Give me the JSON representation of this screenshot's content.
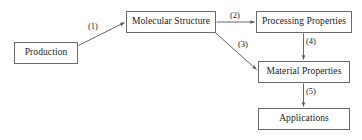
{
  "diagram": {
    "background_color": "#ffffff",
    "line_color": "#555555",
    "box_border_color": "#6b6b6b",
    "text_color": "#1a1a1a",
    "nodes": [
      {
        "id": "production",
        "label": "Production",
        "x": 14,
        "y": 42,
        "w": 64,
        "h": 22
      },
      {
        "id": "molecular-structure",
        "label": "Molecular Structure",
        "x": 126,
        "y": 11,
        "w": 90,
        "h": 22
      },
      {
        "id": "processing-properties",
        "label": "Processing Properties",
        "x": 256,
        "y": 11,
        "w": 96,
        "h": 22
      },
      {
        "id": "material-properties",
        "label": "Material Properties",
        "x": 258,
        "y": 61,
        "w": 92,
        "h": 22
      },
      {
        "id": "applications",
        "label": "Applications",
        "x": 258,
        "y": 108,
        "w": 92,
        "h": 22
      }
    ],
    "edges": [
      {
        "id": "e1",
        "label": "(1)",
        "from": "production",
        "to": "molecular-structure",
        "label_x": 88,
        "label_y": 22
      },
      {
        "id": "e2",
        "label": "(2)",
        "from": "molecular-structure",
        "to": "processing-properties",
        "label_x": 230,
        "label_y": 11
      },
      {
        "id": "e3",
        "label": "(3)",
        "from": "molecular-structure",
        "to": "material-properties",
        "label_x": 238,
        "label_y": 40
      },
      {
        "id": "e4",
        "label": "(4)",
        "from": "processing-properties",
        "to": "material-properties",
        "label_x": 306,
        "label_y": 37
      },
      {
        "id": "e5",
        "label": "(5)",
        "from": "material-properties",
        "to": "applications",
        "label_x": 306,
        "label_y": 87
      }
    ]
  }
}
